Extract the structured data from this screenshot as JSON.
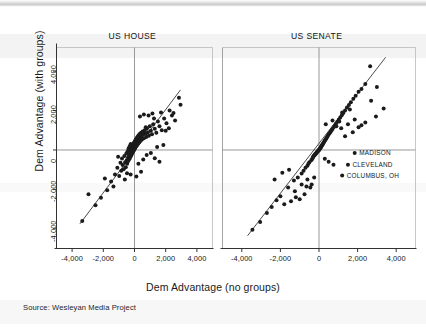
{
  "figure": {
    "axis_label_x": "Dem Advantage (no groups)",
    "axis_label_y": "Dem Advantage (with groups)",
    "source": "Source: Wesleyan Media Project"
  },
  "chart_data": {
    "type": "scatter",
    "title": "",
    "xlabel": "Dem Advantage (no groups)",
    "ylabel": "Dem Advantage (with groups)",
    "xlim": [
      -5000,
      5000
    ],
    "ylim": [
      -5000,
      5200
    ],
    "xticks": [
      -4000,
      -2000,
      0,
      2000,
      4000
    ],
    "xticklabels": [
      "-4,000",
      "-2,000",
      "0",
      "2,000",
      "4,000"
    ],
    "yticks": [
      -4000,
      -2000,
      0,
      2000,
      4000
    ],
    "yticklabels": [
      "-4,000",
      "-2,000",
      "0",
      "2,000",
      "4,000"
    ],
    "grid": false,
    "reference_lines": [
      "x=0",
      "y=0",
      "fit line (y≈x)"
    ],
    "legend": "none",
    "panels": [
      {
        "name": "US HOUSE",
        "label": "US HOUSE",
        "fit_line": {
          "x0": -3500,
          "y0": -3750,
          "x1": 2950,
          "y1": 3050
        },
        "annotations": [],
        "points": [
          [
            -3350,
            -3600
          ],
          [
            -2950,
            -2250
          ],
          [
            -2500,
            -2800
          ],
          [
            -2150,
            -2420
          ],
          [
            -1900,
            -1450
          ],
          [
            -1500,
            -1600
          ],
          [
            -1250,
            -1250
          ],
          [
            -1100,
            -900
          ],
          [
            -980,
            -1320
          ],
          [
            -900,
            -650
          ],
          [
            -850,
            -1050
          ],
          [
            -800,
            -430
          ],
          [
            -760,
            -760
          ],
          [
            -700,
            -980
          ],
          [
            -650,
            -300
          ],
          [
            -600,
            -620
          ],
          [
            -560,
            -880
          ],
          [
            -520,
            -180
          ],
          [
            -500,
            -520
          ],
          [
            -470,
            -700
          ],
          [
            -440,
            -60
          ],
          [
            -420,
            -400
          ],
          [
            -400,
            -560
          ],
          [
            -380,
            80
          ],
          [
            -360,
            -300
          ],
          [
            -340,
            -470
          ],
          [
            -320,
            160
          ],
          [
            -300,
            -210
          ],
          [
            -290,
            -390
          ],
          [
            -270,
            240
          ],
          [
            -260,
            -140
          ],
          [
            -250,
            -330
          ],
          [
            -240,
            300
          ],
          [
            -230,
            -80
          ],
          [
            -220,
            -280
          ],
          [
            -210,
            60
          ],
          [
            -200,
            -30
          ],
          [
            -190,
            -230
          ],
          [
            -180,
            120
          ],
          [
            -170,
            20
          ],
          [
            -160,
            -180
          ],
          [
            -150,
            180
          ],
          [
            -140,
            60
          ],
          [
            -130,
            -130
          ],
          [
            -120,
            240
          ],
          [
            -110,
            100
          ],
          [
            -100,
            -90
          ],
          [
            -90,
            280
          ],
          [
            -80,
            140
          ],
          [
            -70,
            -50
          ],
          [
            -60,
            320
          ],
          [
            -50,
            180
          ],
          [
            -40,
            -10
          ],
          [
            -30,
            360
          ],
          [
            -20,
            220
          ],
          [
            -10,
            40
          ],
          [
            0,
            400
          ],
          [
            10,
            260
          ],
          [
            20,
            80
          ],
          [
            30,
            440
          ],
          [
            40,
            300
          ],
          [
            50,
            120
          ],
          [
            60,
            480
          ],
          [
            70,
            340
          ],
          [
            80,
            160
          ],
          [
            90,
            520
          ],
          [
            100,
            380
          ],
          [
            110,
            200
          ],
          [
            120,
            560
          ],
          [
            130,
            420
          ],
          [
            140,
            240
          ],
          [
            150,
            600
          ],
          [
            160,
            460
          ],
          [
            170,
            280
          ],
          [
            180,
            640
          ],
          [
            190,
            500
          ],
          [
            200,
            320
          ],
          [
            220,
            700
          ],
          [
            240,
            540
          ],
          [
            260,
            360
          ],
          [
            280,
            760
          ],
          [
            300,
            600
          ],
          [
            320,
            420
          ],
          [
            350,
            820
          ],
          [
            380,
            660
          ],
          [
            400,
            480
          ],
          [
            430,
            880
          ],
          [
            460,
            720
          ],
          [
            490,
            540
          ],
          [
            520,
            940
          ],
          [
            560,
            780
          ],
          [
            600,
            600
          ],
          [
            650,
            1000
          ],
          [
            700,
            840
          ],
          [
            750,
            660
          ],
          [
            800,
            1100
          ],
          [
            860,
            900
          ],
          [
            920,
            720
          ],
          [
            980,
            1200
          ],
          [
            1050,
            980
          ],
          [
            1120,
            800
          ],
          [
            1200,
            1300
          ],
          [
            1300,
            1080
          ],
          [
            1400,
            880
          ],
          [
            1500,
            1450
          ],
          [
            1600,
            1200
          ],
          [
            1750,
            1000
          ],
          [
            1900,
            1600
          ],
          [
            2050,
            1350
          ],
          [
            2200,
            1100
          ],
          [
            2400,
            1750
          ],
          [
            2600,
            1500
          ],
          [
            2850,
            2650
          ],
          [
            2950,
            2300
          ],
          [
            2500,
            1880
          ],
          [
            1150,
            1850
          ],
          [
            600,
            1800
          ],
          [
            900,
            1750
          ],
          [
            350,
            1700
          ],
          [
            1700,
            1900
          ],
          [
            2250,
            2000
          ],
          [
            -1750,
            -2050
          ],
          [
            -1350,
            -1850
          ],
          [
            -620,
            -1500
          ],
          [
            -250,
            -1250
          ],
          [
            120,
            -1350
          ],
          [
            420,
            -1100
          ],
          [
            -1050,
            -350
          ],
          [
            -480,
            -1180
          ],
          [
            250,
            -700
          ],
          [
            560,
            -480
          ],
          [
            780,
            -250
          ],
          [
            1050,
            -150
          ],
          [
            1300,
            -420
          ],
          [
            1600,
            -600
          ],
          [
            2000,
            980
          ],
          [
            1450,
            150
          ],
          [
            1850,
            250
          ],
          [
            720,
            1150
          ],
          [
            1250,
            1600
          ]
        ]
      },
      {
        "name": "US SENATE",
        "label": "US SENATE",
        "fit_line": {
          "x0": -3700,
          "y0": -4350,
          "x1": 3450,
          "y1": 4700
        },
        "annotations": [
          {
            "label": "MADISON",
            "x": 1850,
            "y": -150
          },
          {
            "label": "CLEVELAND",
            "x": 1500,
            "y": -750
          },
          {
            "label": "COLUMBUS, OH",
            "x": 1200,
            "y": -1300
          }
        ],
        "points": [
          [
            -3450,
            -4050
          ],
          [
            -3050,
            -3650
          ],
          [
            -2700,
            -3200
          ],
          [
            -2450,
            -2900
          ],
          [
            -2200,
            -2550
          ],
          [
            -2000,
            -2350
          ],
          [
            -1800,
            -2750
          ],
          [
            -1600,
            -1900
          ],
          [
            -1450,
            -2600
          ],
          [
            -1300,
            -1550
          ],
          [
            -1200,
            -2400
          ],
          [
            -1100,
            -1400
          ],
          [
            -1000,
            -2500
          ],
          [
            -900,
            -1200
          ],
          [
            -800,
            -1050
          ],
          [
            -750,
            -2250
          ],
          [
            -700,
            -900
          ],
          [
            -650,
            -1850
          ],
          [
            -600,
            -800
          ],
          [
            -550,
            -700
          ],
          [
            -500,
            -620
          ],
          [
            -450,
            -1900
          ],
          [
            -400,
            -520
          ],
          [
            -380,
            -1750
          ],
          [
            -350,
            -450
          ],
          [
            -320,
            -400
          ],
          [
            -300,
            -350
          ],
          [
            -280,
            -300
          ],
          [
            -250,
            -280
          ],
          [
            -220,
            -250
          ],
          [
            -200,
            -220
          ],
          [
            -180,
            -200
          ],
          [
            -160,
            -180
          ],
          [
            -140,
            -150
          ],
          [
            -120,
            -130
          ],
          [
            -100,
            -100
          ],
          [
            -80,
            -80
          ],
          [
            -60,
            -60
          ],
          [
            -40,
            -40
          ],
          [
            -20,
            -20
          ],
          [
            0,
            0
          ],
          [
            20,
            30
          ],
          [
            40,
            60
          ],
          [
            60,
            90
          ],
          [
            80,
            120
          ],
          [
            100,
            150
          ],
          [
            120,
            180
          ],
          [
            140,
            210
          ],
          [
            160,
            240
          ],
          [
            180,
            280
          ],
          [
            200,
            320
          ],
          [
            230,
            360
          ],
          [
            260,
            400
          ],
          [
            290,
            450
          ],
          [
            320,
            500
          ],
          [
            350,
            550
          ],
          [
            380,
            600
          ],
          [
            420,
            660
          ],
          [
            460,
            720
          ],
          [
            500,
            780
          ],
          [
            550,
            850
          ],
          [
            600,
            920
          ],
          [
            650,
            990
          ],
          [
            700,
            1060
          ],
          [
            760,
            1150
          ],
          [
            820,
            1240
          ],
          [
            880,
            1330
          ],
          [
            950,
            1430
          ],
          [
            1020,
            1530
          ],
          [
            1100,
            1650
          ],
          [
            1180,
            1760
          ],
          [
            1260,
            1880
          ],
          [
            1350,
            2000
          ],
          [
            1450,
            2150
          ],
          [
            1550,
            2280
          ],
          [
            1650,
            2420
          ],
          [
            1780,
            2600
          ],
          [
            1900,
            2750
          ],
          [
            2050,
            2950
          ],
          [
            2200,
            3100
          ],
          [
            2400,
            3350
          ],
          [
            2650,
            4250
          ],
          [
            2050,
            1150
          ],
          [
            1750,
            900
          ],
          [
            2400,
            1400
          ],
          [
            1350,
            700
          ],
          [
            1150,
            1100
          ],
          [
            1500,
            1300
          ],
          [
            1850,
            1550
          ],
          [
            2200,
            1250
          ],
          [
            3350,
            2100
          ],
          [
            2950,
            1700
          ],
          [
            1050,
            1450
          ],
          [
            900,
            1200
          ],
          [
            700,
            1500
          ],
          [
            350,
            1300
          ],
          [
            -250,
            -1400
          ],
          [
            -600,
            -1500
          ],
          [
            -900,
            -1750
          ],
          [
            -1550,
            -1000
          ],
          [
            -1900,
            -1150
          ],
          [
            -2300,
            -1500
          ],
          [
            -1250,
            -2100
          ],
          [
            500,
            -600
          ],
          [
            750,
            -750
          ],
          [
            300,
            -450
          ],
          [
            1200,
            1900
          ],
          [
            1600,
            2050
          ],
          [
            2700,
            2500
          ],
          [
            3000,
            3200
          ]
        ]
      }
    ]
  },
  "panels_meta": {
    "left_title": "US HOUSE",
    "right_title": "US SENATE"
  }
}
